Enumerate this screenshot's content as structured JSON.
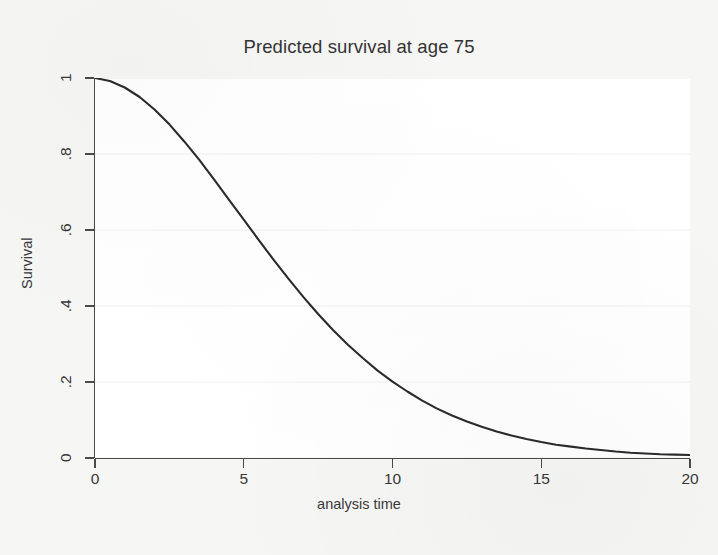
{
  "figure": {
    "title": "Predicted survival at age 75",
    "background_color": "#f6f6f4",
    "plot_background_color": "#ffffff",
    "curve_color": "#2b2b2b",
    "axis_color": "#4a4a4a",
    "gridline_color": "#f0f0ee"
  },
  "chart_data": {
    "type": "line",
    "title": "Predicted survival at age 75",
    "xlabel": "analysis time",
    "ylabel": "Survival",
    "xlim": [
      0,
      20
    ],
    "ylim": [
      0,
      1
    ],
    "grid": true,
    "legend": "none",
    "xticks": [
      0,
      5,
      10,
      15,
      20
    ],
    "xtick_labels": [
      "0",
      "5",
      "10",
      "15",
      "20"
    ],
    "yticks": [
      0,
      0.2,
      0.4,
      0.6,
      0.8,
      1
    ],
    "ytick_labels": [
      "0",
      ".2",
      ".4",
      ".6",
      ".8",
      "1"
    ],
    "series": [
      {
        "name": "Predicted survival at age 75",
        "color": "#2b2b2b",
        "x": [
          0,
          0.5,
          1,
          1.5,
          2,
          2.5,
          3,
          3.5,
          4,
          4.5,
          5,
          5.5,
          6,
          6.5,
          7,
          7.5,
          8,
          8.5,
          9,
          9.5,
          10,
          10.5,
          11,
          11.5,
          12,
          12.5,
          13,
          13.5,
          14,
          14.5,
          15,
          15.5,
          16,
          16.5,
          17,
          17.5,
          18,
          18.5,
          19,
          19.5,
          20
        ],
        "y": [
          1.0,
          0.992,
          0.975,
          0.95,
          0.917,
          0.878,
          0.833,
          0.785,
          0.733,
          0.68,
          0.627,
          0.574,
          0.522,
          0.472,
          0.424,
          0.379,
          0.337,
          0.298,
          0.263,
          0.23,
          0.201,
          0.175,
          0.151,
          0.13,
          0.112,
          0.096,
          0.082,
          0.07,
          0.059,
          0.05,
          0.042,
          0.035,
          0.03,
          0.025,
          0.021,
          0.017,
          0.014,
          0.012,
          0.01,
          0.009,
          0.008
        ]
      }
    ]
  },
  "axes": {
    "y_tick_labels": [
      "1",
      ".8",
      ".6",
      ".4",
      ".2",
      "0"
    ],
    "x_tick_labels": [
      "0",
      "5",
      "10",
      "15",
      "20"
    ],
    "x_title": "analysis time",
    "y_title": "Survival"
  }
}
